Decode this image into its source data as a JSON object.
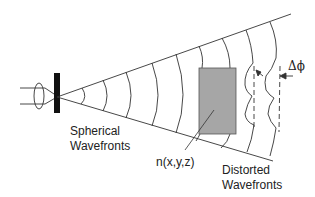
{
  "diagram": {
    "labels": {
      "spherical": [
        "Spherical",
        "Wavefronts"
      ],
      "medium": "n(x,y,z)",
      "distorted": [
        "Distorted",
        "Wavefronts"
      ],
      "phase_shift": "Δϕ"
    },
    "colors": {
      "line": "#333333",
      "medium_fill": "#a6a6a6",
      "aperture": "#111111",
      "background": "#ffffff"
    },
    "elements": [
      {
        "id": "lens",
        "type": "lens",
        "description": "converging lens"
      },
      {
        "id": "aperture",
        "type": "bar",
        "description": "black aperture/pinhole"
      },
      {
        "id": "cone",
        "type": "lines",
        "description": "diverging beam boundaries"
      },
      {
        "id": "spherical-wavefronts",
        "type": "arcs",
        "count": 8
      },
      {
        "id": "medium",
        "type": "rect",
        "description": "refractive index region n(x,y,z)"
      },
      {
        "id": "distorted-wavefronts",
        "type": "wavy-lines",
        "count": 2
      },
      {
        "id": "reference-planes",
        "type": "dashed-lines",
        "count": 2
      }
    ]
  }
}
